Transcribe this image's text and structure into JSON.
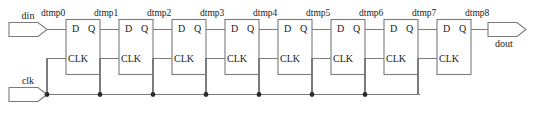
{
  "diagram": {
    "type": "schematic",
    "colors": {
      "wire": "#7b7b7b",
      "text": "#1a1a1a",
      "junction": "#2b2b2b",
      "background": "#ffffff"
    },
    "ports": [
      {
        "id": "din",
        "label": "din",
        "direction": "input"
      },
      {
        "id": "clk",
        "label": "clk",
        "direction": "input"
      },
      {
        "id": "dout",
        "label": "dout",
        "direction": "output"
      }
    ],
    "nets": [
      {
        "id": "n0",
        "label": "dtmp0"
      },
      {
        "id": "n1",
        "label": "dtmp1"
      },
      {
        "id": "n2",
        "label": "dtmp2"
      },
      {
        "id": "n3",
        "label": "dtmp3"
      },
      {
        "id": "n4",
        "label": "dtmp4"
      },
      {
        "id": "n5",
        "label": "dtmp5"
      },
      {
        "id": "n6",
        "label": "dtmp6"
      },
      {
        "id": "n7",
        "label": "dtmp7"
      },
      {
        "id": "n8",
        "label": "dtmp8"
      }
    ],
    "flipflops": [
      {
        "id": "ff0",
        "pin_d": "D",
        "pin_q": "Q",
        "pin_clk": "CLK"
      },
      {
        "id": "ff1",
        "pin_d": "D",
        "pin_q": "Q",
        "pin_clk": "CLK"
      },
      {
        "id": "ff2",
        "pin_d": "D",
        "pin_q": "Q",
        "pin_clk": "CLK"
      },
      {
        "id": "ff3",
        "pin_d": "D",
        "pin_q": "Q",
        "pin_clk": "CLK"
      },
      {
        "id": "ff4",
        "pin_d": "D",
        "pin_q": "Q",
        "pin_clk": "CLK"
      },
      {
        "id": "ff5",
        "pin_d": "D",
        "pin_q": "Q",
        "pin_clk": "CLK"
      },
      {
        "id": "ff6",
        "pin_d": "D",
        "pin_q": "Q",
        "pin_clk": "CLK"
      },
      {
        "id": "ff7",
        "pin_d": "D",
        "pin_q": "Q",
        "pin_clk": "CLK"
      }
    ]
  }
}
